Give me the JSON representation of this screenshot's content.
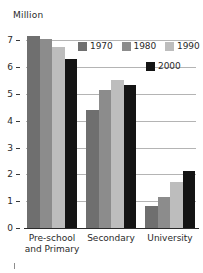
{
  "chart_data": {
    "type": "bar",
    "title": "",
    "subtitle": "",
    "unit_label": "Million",
    "xlabel": "",
    "ylabel": "Million",
    "categories": [
      "Pre-school\nand Primary",
      "Secondary",
      "University"
    ],
    "series": [
      {
        "name": "1970",
        "color": "#6f6f6f",
        "values": [
          7.15,
          4.42,
          0.82
        ]
      },
      {
        "name": "1980",
        "color": "#8c8c8c",
        "values": [
          7.05,
          5.15,
          1.17
        ]
      },
      {
        "name": "1990",
        "color": "#bdbdbd",
        "values": [
          6.75,
          5.52,
          1.7
        ]
      },
      {
        "name": "2000",
        "color": "#141414",
        "values": [
          6.3,
          5.35,
          2.13
        ]
      }
    ],
    "ylim": [
      0,
      7.35
    ],
    "yticks": [
      0,
      1,
      2,
      3,
      4,
      5,
      6,
      7
    ],
    "ytick_labels": [
      "0",
      "1",
      "2",
      "3",
      "4",
      "5",
      "6",
      "7"
    ],
    "grid": true,
    "gridlines_at": [
      1,
      2,
      3,
      4,
      5,
      6,
      7
    ],
    "legend_position": "top-right",
    "legend_rows": [
      [
        "1970",
        "1980",
        "1990"
      ],
      [
        "2000"
      ]
    ]
  },
  "colors": {
    "background": "#ffffff",
    "gridline": "#b4b4b4",
    "axis": "#2b2b2b",
    "text": "#2a2a2a"
  }
}
